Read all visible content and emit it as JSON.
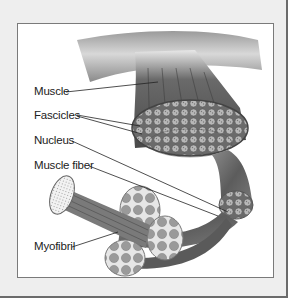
{
  "figure": {
    "labels": [
      {
        "id": "muscle",
        "text": "Muscle"
      },
      {
        "id": "fascicles",
        "text": "Fascicles"
      },
      {
        "id": "nucleus",
        "text": "Nucleus"
      },
      {
        "id": "muscle_fiber",
        "text": "Muscle fiber"
      },
      {
        "id": "myofibril",
        "text": "Myofibril"
      }
    ]
  },
  "colors": {
    "frame_bg": "#eeeeee",
    "frame_border": "#6b6b6b",
    "panel_bg": "#ffffff",
    "muscle_dark": "#555555",
    "muscle_light": "#bdbdbd"
  }
}
